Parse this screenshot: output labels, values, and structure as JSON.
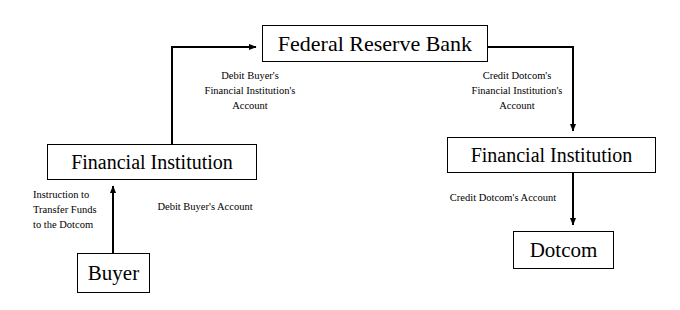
{
  "diagram": {
    "background_color": "#ffffff",
    "line_color": "#000000",
    "nodes": {
      "federal_reserve_bank": "Federal Reserve Bank",
      "financial_institution_left": "Financial Institution",
      "financial_institution_right": "Financial Institution",
      "buyer": "Buyer",
      "dotcom": "Dotcom"
    },
    "edge_labels": {
      "debit_buyer_fi_account": {
        "line1": "Debit Buyer's",
        "line2": "Financial Institution's",
        "line3": "Account"
      },
      "credit_dotcom_fi_account": {
        "line1": "Credit Dotcom's",
        "line2": "Financial Institution's",
        "line3": "Account"
      },
      "instruction_transfer_funds": {
        "line1": "Instruction to",
        "line2": "Transfer Funds",
        "line3": "to the Dotcom"
      },
      "debit_buyer_account": "Debit Buyer's Account",
      "credit_dotcom_account": "Credit Dotcom's Account"
    }
  }
}
